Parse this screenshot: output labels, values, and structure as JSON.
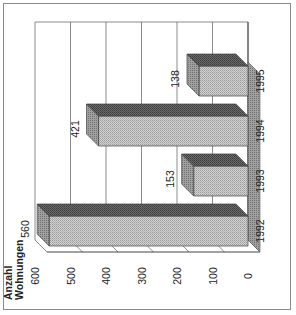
{
  "chart_data": {
    "type": "bar",
    "orientation": "3d-column, rotated 90deg counter-clockwise",
    "title": "",
    "xlabel": "",
    "ylabel": "Anzahl Wohnungen",
    "ylabel_lines": [
      "Anzahl",
      "Wohnungen"
    ],
    "categories": [
      "1992",
      "1993",
      "1994",
      "1995"
    ],
    "values": [
      560,
      153,
      421,
      138
    ],
    "data_labels": [
      "560",
      "153",
      "421",
      "138"
    ],
    "ylim": [
      0,
      600
    ],
    "yticks": [
      "0",
      "100",
      "200",
      "300",
      "400",
      "500",
      "600"
    ],
    "grid": true,
    "legend": null,
    "colors": {
      "front": "#c4c4c4",
      "top": "#5a5a5a",
      "side": "#8c8c8c",
      "grid": "#6e6e6e",
      "frame": "#8a8a8a"
    }
  }
}
